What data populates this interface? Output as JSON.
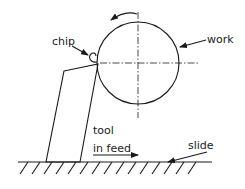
{
  "diagram": {
    "type": "machining-schematic",
    "labels": {
      "chip": "chip",
      "work": "work",
      "tool": "tool",
      "in_feed": "in feed",
      "slide": "slide"
    },
    "colors": {
      "line": "#1a1a1a",
      "background": "#ffffff"
    },
    "elements": [
      {
        "name": "workpiece",
        "shape": "circle",
        "rotation": "counter-clockwise"
      },
      {
        "name": "cutting-tool",
        "shape": "quadrilateral"
      },
      {
        "name": "chip",
        "shape": "curl"
      },
      {
        "name": "slide",
        "shape": "hatched-ground-line"
      },
      {
        "name": "in-feed-arrow",
        "direction": "right"
      }
    ]
  }
}
